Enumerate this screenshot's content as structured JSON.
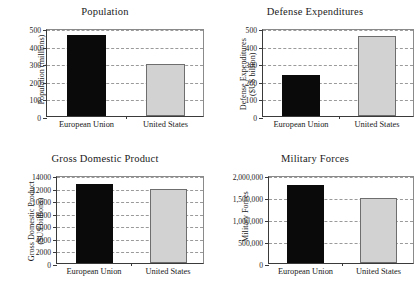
{
  "figure": {
    "background": "#ffffff",
    "series_colors": {
      "european_union": "#0a0a0a",
      "united_states": "#d2d2d2"
    }
  },
  "charts": [
    {
      "id": "population",
      "title": "Population",
      "ylabel": "Population (millions)",
      "ylabel_lines": [
        "Population (millions)"
      ],
      "categories": [
        "European Union",
        "United States"
      ],
      "values": [
        458,
        296
      ],
      "ticks": [
        "0",
        "100",
        "200",
        "300",
        "400",
        "500"
      ],
      "tick_values": [
        0,
        100,
        200,
        300,
        400,
        500
      ],
      "ylim": [
        0,
        500
      ]
    },
    {
      "id": "defense-expenditures",
      "title": "Defense Expenditures",
      "ylabel": "Defense Expenditures ($US billion)",
      "ylabel_lines": [
        "Defense Expenditures",
        "($US billion)"
      ],
      "categories": [
        "European Union",
        "United States"
      ],
      "values": [
        232,
        455
      ],
      "ticks": [
        "0",
        "100",
        "200",
        "300",
        "400",
        "500"
      ],
      "tick_values": [
        0,
        100,
        200,
        300,
        400,
        500
      ],
      "ylim": [
        0,
        500
      ]
    },
    {
      "id": "gross-domestic-product",
      "title": "Gross Domestic Product",
      "ylabel": "Gross Domestic Product ($US billions)",
      "ylabel_lines": [
        "Gross Domestic Product",
        "($US billions)"
      ],
      "categories": [
        "European Union",
        "United States"
      ],
      "values": [
        12600,
        11700
      ],
      "ticks": [
        "0",
        "2000",
        "4000",
        "6000",
        "8000",
        "10000",
        "12000",
        "14000"
      ],
      "tick_values": [
        0,
        2000,
        4000,
        6000,
        8000,
        10000,
        12000,
        14000
      ],
      "ylim": [
        0,
        14000
      ]
    },
    {
      "id": "military-forces",
      "title": "Military Forces",
      "ylabel": "Military Forces",
      "ylabel_lines": [
        "Military Forces"
      ],
      "categories": [
        "European Union",
        "United States"
      ],
      "values": [
        1780000,
        1480000
      ],
      "ticks": [
        "0",
        "500,000",
        "1,000,000",
        "1,500,000",
        "2,000,000"
      ],
      "tick_values": [
        0,
        500000,
        1000000,
        1500000,
        2000000
      ],
      "ylim": [
        0,
        2000000
      ]
    }
  ],
  "chart_data": [
    {
      "type": "bar",
      "title": "Population",
      "xlabel": "",
      "ylabel": "Population (millions)",
      "categories": [
        "European Union",
        "United States"
      ],
      "values": [
        458,
        296
      ],
      "ylim": [
        0,
        500
      ],
      "yticks": [
        0,
        100,
        200,
        300,
        400,
        500
      ],
      "grid": true,
      "legend": "none",
      "colors": [
        "#0a0a0a",
        "#d2d2d2"
      ]
    },
    {
      "type": "bar",
      "title": "Defense Expenditures",
      "xlabel": "",
      "ylabel": "Defense Expenditures ($US billion)",
      "categories": [
        "European Union",
        "United States"
      ],
      "values": [
        232,
        455
      ],
      "ylim": [
        0,
        500
      ],
      "yticks": [
        0,
        100,
        200,
        300,
        400,
        500
      ],
      "grid": true,
      "legend": "none",
      "colors": [
        "#0a0a0a",
        "#d2d2d2"
      ]
    },
    {
      "type": "bar",
      "title": "Gross Domestic Product",
      "xlabel": "",
      "ylabel": "Gross Domestic Product ($US billions)",
      "categories": [
        "European Union",
        "United States"
      ],
      "values": [
        12600,
        11700
      ],
      "ylim": [
        0,
        14000
      ],
      "yticks": [
        0,
        2000,
        4000,
        6000,
        8000,
        10000,
        12000,
        14000
      ],
      "grid": true,
      "legend": "none",
      "colors": [
        "#0a0a0a",
        "#d2d2d2"
      ]
    },
    {
      "type": "bar",
      "title": "Military Forces",
      "xlabel": "",
      "ylabel": "Military Forces",
      "categories": [
        "European Union",
        "United States"
      ],
      "values": [
        1780000,
        1480000
      ],
      "ylim": [
        0,
        2000000
      ],
      "yticks": [
        0,
        500000,
        1000000,
        1500000,
        2000000
      ],
      "grid": true,
      "legend": "none",
      "colors": [
        "#0a0a0a",
        "#d2d2d2"
      ]
    }
  ]
}
